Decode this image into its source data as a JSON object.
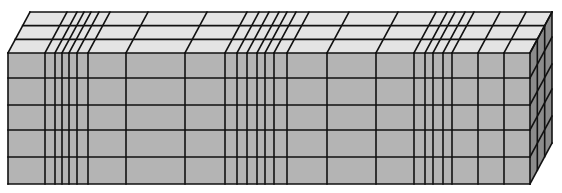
{
  "diagram": {
    "type": "3d-box-grid",
    "colors": {
      "front": "#b4b4b4",
      "top": "#e4e4e4",
      "side": "#8c8c8c",
      "line": "#111111"
    },
    "front": {
      "x0": 8,
      "x1": 530,
      "y0": 53,
      "y1": 184
    },
    "depth": {
      "dx": 22,
      "dy": -41
    },
    "vertical_divisions_x": [
      8,
      45,
      55,
      62,
      69,
      77,
      88,
      126,
      185,
      225,
      237,
      247,
      257,
      265,
      274,
      287,
      327,
      376,
      414,
      425,
      433,
      443,
      452,
      478,
      504,
      530
    ],
    "horizontal_divisions_y": [
      53,
      78,
      105,
      130,
      157,
      184
    ],
    "depth_divisions": 3
  }
}
